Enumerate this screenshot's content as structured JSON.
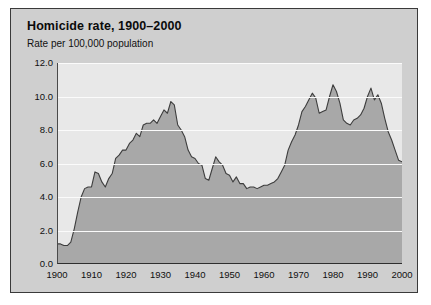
{
  "card": {
    "title": "Homicide rate, 1900–2000",
    "subtitle": "Rate per 100,000 population"
  },
  "colors": {
    "card_background": "#cfcfcf",
    "plot_background": "#e8e8e8",
    "area_fill": "#a8a8a8",
    "line": "#3d3d3d",
    "gridline": "#fbfbfb",
    "axis": "#2e2e2e",
    "text": "#101010"
  },
  "chart_data": {
    "type": "area",
    "title": "Homicide rate, 1900–2000",
    "subtitle": "Rate per 100,000 population",
    "xlabel": "",
    "ylabel": "Rate per 100,000 population",
    "xlim": [
      1900,
      2000
    ],
    "ylim": [
      0.0,
      12.0
    ],
    "grid": true,
    "legend": false,
    "ytick_labels": [
      "0.0",
      "2.0",
      "4.0",
      "6.0",
      "8.0",
      "10.0",
      "12.0"
    ],
    "yticks": [
      0.0,
      2.0,
      4.0,
      6.0,
      8.0,
      10.0,
      12.0
    ],
    "xtick_labels": [
      "1900",
      "1910",
      "1920",
      "1930",
      "1940",
      "1950",
      "1960",
      "1970",
      "1980",
      "1990",
      "2000"
    ],
    "xticks": [
      1900,
      1910,
      1920,
      1930,
      1940,
      1950,
      1960,
      1970,
      1980,
      1990,
      2000
    ],
    "x": [
      1900,
      1901,
      1902,
      1903,
      1904,
      1905,
      1906,
      1907,
      1908,
      1909,
      1910,
      1911,
      1912,
      1913,
      1914,
      1915,
      1916,
      1917,
      1918,
      1919,
      1920,
      1921,
      1922,
      1923,
      1924,
      1925,
      1926,
      1927,
      1928,
      1929,
      1930,
      1931,
      1932,
      1933,
      1934,
      1935,
      1936,
      1937,
      1938,
      1939,
      1940,
      1941,
      1942,
      1943,
      1944,
      1945,
      1946,
      1947,
      1948,
      1949,
      1950,
      1951,
      1952,
      1953,
      1954,
      1955,
      1956,
      1957,
      1958,
      1959,
      1960,
      1961,
      1962,
      1963,
      1964,
      1965,
      1966,
      1967,
      1968,
      1969,
      1970,
      1971,
      1972,
      1973,
      1974,
      1975,
      1976,
      1977,
      1978,
      1979,
      1980,
      1981,
      1982,
      1983,
      1984,
      1985,
      1986,
      1987,
      1988,
      1989,
      1990,
      1991,
      1992,
      1993,
      1994,
      1995,
      1996,
      1997,
      1998,
      1999,
      2000
    ],
    "values": [
      1.2,
      1.2,
      1.1,
      1.1,
      1.3,
      2.1,
      3.1,
      4.0,
      4.5,
      4.6,
      4.6,
      5.5,
      5.4,
      4.9,
      4.6,
      5.1,
      5.4,
      6.3,
      6.5,
      6.8,
      6.8,
      7.2,
      7.4,
      7.8,
      7.6,
      8.3,
      8.4,
      8.4,
      8.6,
      8.4,
      8.8,
      9.2,
      9.0,
      9.7,
      9.5,
      8.3,
      8.0,
      7.6,
      6.8,
      6.4,
      6.3,
      6.0,
      5.9,
      5.1,
      5.0,
      5.7,
      6.4,
      6.1,
      5.9,
      5.4,
      5.3,
      4.9,
      5.2,
      4.8,
      4.8,
      4.5,
      4.6,
      4.6,
      4.5,
      4.6,
      4.7,
      4.7,
      4.8,
      4.9,
      5.1,
      5.5,
      5.9,
      6.8,
      7.3,
      7.7,
      8.3,
      9.1,
      9.4,
      9.8,
      10.2,
      9.9,
      9.0,
      9.1,
      9.2,
      10.0,
      10.7,
      10.3,
      9.6,
      8.6,
      8.4,
      8.3,
      8.6,
      8.7,
      8.9,
      9.3,
      10.0,
      10.5,
      9.8,
      10.1,
      9.6,
      8.7,
      7.9,
      7.4,
      6.8,
      6.2,
      6.1
    ],
    "annotations": {
      "peak_1933": 9.7,
      "peak_1980": 10.7,
      "peak_1991": 10.5,
      "low_1903": 1.1,
      "low_1958": 4.5,
      "end_2000": 6.1
    }
  }
}
